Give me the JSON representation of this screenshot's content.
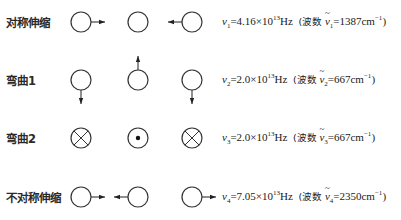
{
  "modes": [
    {
      "label": "对称伸缩",
      "nu_symbol": "ν",
      "index": "1",
      "value": "4.16×10",
      "exponent": "13",
      "unit": "Hz",
      "wavenumber_prefix": "(波数",
      "wavenumber_value": "=1387cm",
      "wavenumber_exp": "−1",
      "close": ")",
      "atoms": [
        {
          "type": "plain",
          "arrow": "right"
        },
        {
          "type": "plain",
          "arrow": "none"
        },
        {
          "type": "plain",
          "arrow": "left"
        }
      ]
    },
    {
      "label": "弯曲1",
      "nu_symbol": "ν",
      "index": "2",
      "value": "2.0×10",
      "exponent": "13",
      "unit": "Hz",
      "wavenumber_prefix": "(波数",
      "wavenumber_value": "=667cm",
      "wavenumber_exp": "−1",
      "close": ")",
      "atoms": [
        {
          "type": "plain",
          "arrow": "down"
        },
        {
          "type": "plain",
          "arrow": "up"
        },
        {
          "type": "plain",
          "arrow": "down"
        }
      ]
    },
    {
      "label": "弯曲2",
      "nu_symbol": "ν",
      "index": "3",
      "value": "2.0×10",
      "exponent": "13",
      "unit": "Hz",
      "wavenumber_prefix": "(波数",
      "wavenumber_value": "=667cm",
      "wavenumber_exp": "−1",
      "close": ")",
      "atoms": [
        {
          "type": "into-page",
          "arrow": "none"
        },
        {
          "type": "out-of-page",
          "arrow": "none"
        },
        {
          "type": "into-page",
          "arrow": "none"
        }
      ]
    },
    {
      "label": "不对称伸缩",
      "nu_symbol": "ν",
      "index": "4",
      "value": "7.05×10",
      "exponent": "13",
      "unit": "Hz",
      "wavenumber_prefix": "(波数",
      "wavenumber_value": "=2350cm",
      "wavenumber_exp": "−1",
      "close": ")",
      "atoms": [
        {
          "type": "plain",
          "arrow": "right"
        },
        {
          "type": "plain",
          "arrow": "left"
        },
        {
          "type": "plain",
          "arrow": "right"
        }
      ]
    }
  ]
}
